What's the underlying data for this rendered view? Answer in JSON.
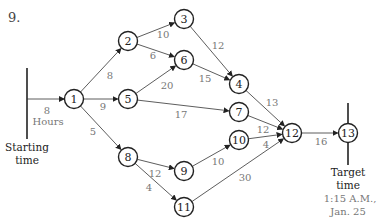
{
  "problem_number": "9.",
  "start": {
    "line1": "Starting",
    "line2": "time",
    "edge_weight": "8",
    "edge_unit": "Hours"
  },
  "target": {
    "line1": "Target",
    "line2": "time",
    "line3": "1:15 A.M.,",
    "line4": "Jan. 25"
  },
  "nodes": [
    {
      "id": "1",
      "x": 74,
      "y": 99
    },
    {
      "id": "2",
      "x": 128,
      "y": 41
    },
    {
      "id": "3",
      "x": 184,
      "y": 19
    },
    {
      "id": "4",
      "x": 239,
      "y": 84
    },
    {
      "id": "5",
      "x": 128,
      "y": 99
    },
    {
      "id": "6",
      "x": 184,
      "y": 60
    },
    {
      "id": "7",
      "x": 239,
      "y": 112
    },
    {
      "id": "8",
      "x": 128,
      "y": 157
    },
    {
      "id": "9",
      "x": 184,
      "y": 171
    },
    {
      "id": "10",
      "x": 239,
      "y": 140
    },
    {
      "id": "11",
      "x": 184,
      "y": 207
    },
    {
      "id": "12",
      "x": 292,
      "y": 133
    },
    {
      "id": "13",
      "x": 348,
      "y": 133
    }
  ],
  "edges": [
    {
      "from": "1",
      "to": "2",
      "w": "8",
      "lx": 110,
      "ly": 75
    },
    {
      "from": "1",
      "to": "5",
      "w": "9",
      "lx": 103,
      "ly": 106
    },
    {
      "from": "1",
      "to": "8",
      "w": "5",
      "lx": 93,
      "ly": 131
    },
    {
      "from": "2",
      "to": "3",
      "w": "10",
      "lx": 163,
      "ly": 34
    },
    {
      "from": "2",
      "to": "6",
      "w": "6",
      "lx": 153,
      "ly": 55
    },
    {
      "from": "3",
      "to": "4",
      "w": "12",
      "lx": 218,
      "ly": 45
    },
    {
      "from": "5",
      "to": "6",
      "w": "20",
      "lx": 167,
      "ly": 85
    },
    {
      "from": "6",
      "to": "4",
      "w": "15",
      "lx": 205,
      "ly": 78
    },
    {
      "from": "5",
      "to": "7",
      "w": "17",
      "lx": 181,
      "ly": 114
    },
    {
      "from": "4",
      "to": "12",
      "w": "13",
      "lx": 272,
      "ly": 102
    },
    {
      "from": "7",
      "to": "12",
      "w": "12",
      "lx": 263,
      "ly": 129
    },
    {
      "from": "10",
      "to": "12",
      "w": "4",
      "lx": 266,
      "ly": 144
    },
    {
      "from": "8",
      "to": "9",
      "w": "12",
      "lx": 155,
      "ly": 173
    },
    {
      "from": "8",
      "to": "11",
      "w": "4",
      "lx": 149,
      "ly": 187
    },
    {
      "from": "9",
      "to": "10",
      "w": "10",
      "lx": 218,
      "ly": 161
    },
    {
      "from": "11",
      "to": "12",
      "w": "30",
      "lx": 245,
      "ly": 177
    },
    {
      "from": "12",
      "to": "13",
      "w": "16",
      "lx": 321,
      "ly": 141
    }
  ]
}
